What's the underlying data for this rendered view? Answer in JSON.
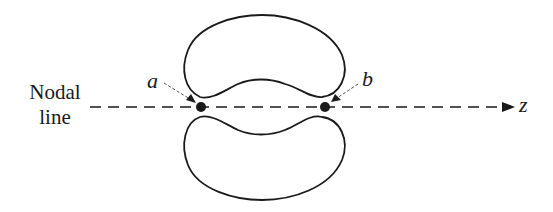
{
  "diagram": {
    "axis_label_line1": "Nodal",
    "axis_label_line2": "line",
    "point_a_label": "a",
    "point_b_label": "b",
    "axis_end_label": "z",
    "colors": {
      "stroke": "#1a1a1a",
      "background": "#ffffff"
    },
    "elements": {
      "upper_lobe": "kidney-shaped closed curve above nodal line",
      "lower_lobe": "kidney-shaped closed curve below nodal line",
      "nodal_line": "dashed horizontal line with arrow pointing toward z",
      "point_a": "filled dot on nodal line at left gap between lobes",
      "point_b": "filled dot on nodal line at right gap between lobes"
    }
  }
}
